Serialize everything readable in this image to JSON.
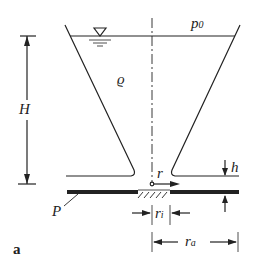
{
  "diagram": {
    "labels": {
      "pressure": "p",
      "pressure_sub": "0",
      "density": "ϱ",
      "height": "H",
      "gap": "h",
      "radius": "r",
      "inner_radius": "r",
      "inner_radius_sub": "i",
      "outer_radius": "r",
      "outer_radius_sub": "a",
      "plate": "P",
      "panel": "a"
    },
    "colors": {
      "line": "#222222",
      "background": "#ffffff"
    }
  }
}
